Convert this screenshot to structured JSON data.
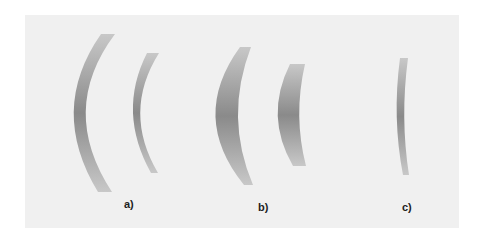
{
  "figure": {
    "background": "#f0f0f0",
    "lens_gradient": {
      "edge": "#c4c4c4",
      "center": "#8a8a8a"
    },
    "groups": [
      {
        "id": "a",
        "label": "a)",
        "description": "two thin meniscus lenses"
      },
      {
        "id": "b",
        "label": "b)",
        "description": "two thick meniscus lenses"
      },
      {
        "id": "c",
        "label": "c)",
        "description": "single thin meniscus lens"
      }
    ]
  }
}
